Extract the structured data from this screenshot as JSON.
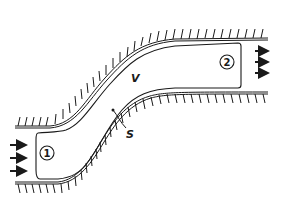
{
  "diagram": {
    "type": "control-volume-flow-in-curved-channel",
    "labels": {
      "inlet": "1",
      "outlet": "2",
      "volume": "V",
      "surface": "S"
    },
    "colors": {
      "stroke": "#1a1a1a",
      "background": "#ffffff"
    }
  }
}
